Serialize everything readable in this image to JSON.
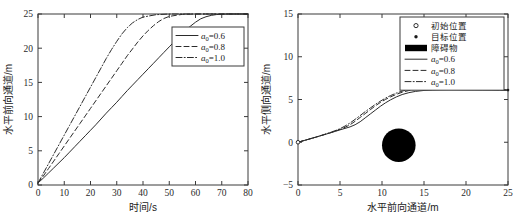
{
  "figure": {
    "background": "#ffffff",
    "line_color": "#2b2b2b",
    "obstacle_color": "#000000"
  },
  "chart_data": [
    {
      "id": "left",
      "type": "line",
      "title": "",
      "xlabel": "时间/s",
      "ylabel": "水平前向通道/m",
      "xlim": [
        0,
        80
      ],
      "ylim": [
        0,
        25
      ],
      "xticks": [
        0,
        10,
        20,
        30,
        40,
        50,
        60,
        70,
        80
      ],
      "yticks": [
        0,
        5,
        10,
        15,
        20,
        25
      ],
      "grid": false,
      "legend_position": "right",
      "legend_entries": [
        "a0=0.6",
        "a0=0.8",
        "a0=1.0"
      ],
      "series": [
        {
          "name": "a0=0.6",
          "label_base": "a",
          "label_sub": "0",
          "label_value": "=0.6",
          "style": "solid",
          "x": [
            0,
            2,
            4,
            6,
            8,
            10,
            12,
            14,
            16,
            18,
            20,
            22,
            24,
            26,
            28,
            30,
            32,
            34,
            36,
            38,
            40,
            42,
            44,
            46,
            48,
            50,
            52,
            54,
            56,
            58,
            60,
            62,
            64,
            66,
            68,
            70,
            72,
            74,
            76,
            78,
            80
          ],
          "y": [
            0.3,
            1.0,
            1.75,
            2.5,
            3.25,
            4.0,
            4.8,
            5.6,
            6.4,
            7.2,
            8.0,
            8.8,
            9.65,
            10.5,
            11.3,
            12.1,
            12.95,
            13.8,
            14.6,
            15.4,
            16.2,
            17.0,
            17.8,
            18.6,
            19.4,
            20.2,
            21.0,
            21.8,
            22.5,
            23.2,
            23.8,
            24.3,
            24.6,
            24.8,
            24.92,
            24.97,
            25.0,
            25.0,
            25.0,
            25.0,
            25.0
          ]
        },
        {
          "name": "a0=0.8",
          "label_base": "a",
          "label_sub": "0",
          "label_value": "=0.8",
          "style": "dashed",
          "x": [
            0,
            2,
            4,
            6,
            8,
            10,
            12,
            14,
            16,
            18,
            20,
            22,
            24,
            26,
            28,
            30,
            32,
            34,
            36,
            38,
            40,
            42,
            44,
            46,
            48,
            50,
            55,
            60,
            65,
            70,
            75,
            80
          ],
          "y": [
            0.3,
            1.3,
            2.4,
            3.5,
            4.6,
            5.7,
            6.8,
            7.9,
            9.0,
            10.1,
            11.2,
            12.3,
            13.4,
            14.5,
            15.6,
            16.7,
            17.8,
            18.9,
            19.9,
            20.9,
            21.8,
            22.6,
            23.3,
            23.9,
            24.35,
            24.65,
            24.95,
            25.0,
            25.0,
            25.0,
            25.0,
            25.0
          ]
        },
        {
          "name": "a0=1.0",
          "label_base": "a",
          "label_sub": "0",
          "label_value": "=1.0",
          "style": "dashdot",
          "x": [
            0,
            2,
            4,
            6,
            8,
            10,
            12,
            14,
            16,
            18,
            20,
            22,
            24,
            26,
            28,
            30,
            32,
            34,
            36,
            38,
            40,
            45,
            50,
            55,
            60,
            65,
            70,
            75,
            80
          ],
          "y": [
            0.3,
            1.7,
            3.1,
            4.5,
            5.9,
            7.3,
            8.7,
            10.1,
            11.5,
            12.9,
            14.3,
            15.7,
            17.1,
            18.5,
            19.8,
            21.0,
            22.1,
            23.0,
            23.7,
            24.2,
            24.55,
            24.9,
            25.0,
            25.0,
            25.0,
            25.0,
            25.0,
            25.0,
            25.0
          ]
        }
      ]
    },
    {
      "id": "right",
      "type": "line",
      "title": "",
      "xlabel": "水平前向通道/m",
      "ylabel": "水平侧向通道/m",
      "xlim": [
        0,
        25
      ],
      "ylim": [
        -5,
        15
      ],
      "xticks": [
        0,
        5,
        10,
        15,
        20,
        25
      ],
      "yticks": [
        -5,
        0,
        5,
        10,
        15
      ],
      "grid": false,
      "legend_position": "upper-right",
      "legend_entries": [
        "初始位置",
        "目标位置",
        "障碍物",
        "a0=0.6",
        "a0=0.8",
        "a0=1.0"
      ],
      "legend_markers": [
        {
          "kind": "circle-open",
          "label": "初始位置"
        },
        {
          "kind": "dot-filled",
          "label": "目标位置"
        },
        {
          "kind": "rect-filled",
          "label": "障碍物"
        }
      ],
      "obstacle": {
        "shape": "circle",
        "cx": 12.0,
        "cy": -0.35,
        "r": 2.0,
        "color": "#000000"
      },
      "start_point": {
        "x": 0,
        "y": 0
      },
      "goal_point": {
        "x": 25,
        "y": 6.1
      },
      "series": [
        {
          "name": "a0=0.6",
          "label_base": "a",
          "label_sub": "0",
          "label_value": "=0.6",
          "style": "solid",
          "x": [
            0,
            1,
            2,
            3,
            4,
            5,
            5.6,
            6.2,
            6.8,
            7.4,
            8,
            8.6,
            9.2,
            9.8,
            10.4,
            11,
            11.7,
            12.4,
            13.2,
            14,
            15,
            16,
            17,
            18,
            19,
            20,
            21,
            22,
            23,
            24,
            25
          ],
          "y": [
            0.0,
            0.28,
            0.56,
            0.85,
            1.14,
            1.45,
            1.62,
            1.8,
            2.05,
            2.4,
            2.85,
            3.3,
            3.75,
            4.2,
            4.6,
            4.95,
            5.3,
            5.58,
            5.8,
            5.95,
            6.06,
            6.12,
            6.15,
            6.16,
            6.15,
            6.14,
            6.13,
            6.12,
            6.11,
            6.1,
            6.1
          ]
        },
        {
          "name": "a0=0.8",
          "label_base": "a",
          "label_sub": "0",
          "label_value": "=0.8",
          "style": "dashed",
          "x": [
            0,
            1,
            2,
            3,
            4,
            5,
            5.6,
            6.2,
            6.8,
            7.4,
            8,
            8.6,
            9.2,
            9.8,
            10.4,
            11,
            11.7,
            12.4,
            13.2,
            14,
            15,
            16,
            17,
            18,
            19,
            20,
            21,
            22,
            23,
            24,
            25
          ],
          "y": [
            0.0,
            0.28,
            0.56,
            0.85,
            1.16,
            1.5,
            1.75,
            2.05,
            2.45,
            2.9,
            3.35,
            3.8,
            4.25,
            4.65,
            5.0,
            5.3,
            5.6,
            5.85,
            6.05,
            6.2,
            6.3,
            6.35,
            6.36,
            6.35,
            6.32,
            6.29,
            6.26,
            6.22,
            6.18,
            6.14,
            6.1
          ]
        },
        {
          "name": "a0=1.0",
          "label_base": "a",
          "label_sub": "0",
          "label_value": "=1.0",
          "style": "dashdot",
          "x": [
            0,
            1,
            2,
            3,
            4,
            5,
            5.6,
            6.2,
            6.8,
            7.4,
            8,
            8.6,
            9.2,
            9.8,
            10.4,
            11,
            11.7,
            12.4,
            13.2,
            14,
            15,
            16,
            17,
            18,
            19,
            20,
            21,
            22,
            23,
            24,
            25
          ],
          "y": [
            0.0,
            0.28,
            0.57,
            0.87,
            1.2,
            1.58,
            1.9,
            2.25,
            2.68,
            3.12,
            3.58,
            4.0,
            4.42,
            4.8,
            5.15,
            5.45,
            5.75,
            5.98,
            6.18,
            6.32,
            6.42,
            6.48,
            6.5,
            6.48,
            6.45,
            6.4,
            6.34,
            6.28,
            6.2,
            6.15,
            6.1
          ]
        }
      ]
    }
  ]
}
